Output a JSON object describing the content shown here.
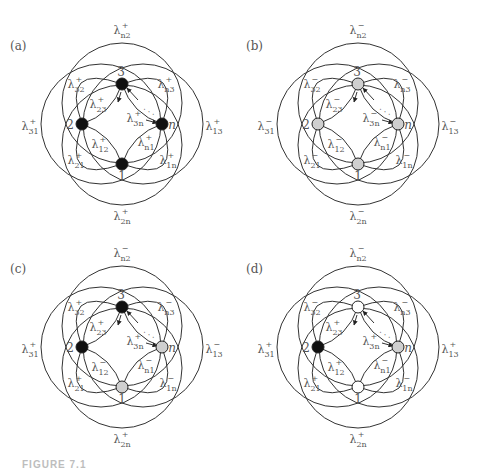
{
  "figure": {
    "caption_fragment": "FIGURE 7.1",
    "node_colors": {
      "black": "#111111",
      "gray": "#cfcfcf",
      "white": "#ffffff"
    },
    "edge_color": "#333333",
    "panels": [
      {
        "id": "a",
        "label": "(a)",
        "nodes": [
          {
            "name": "3",
            "fill": "black"
          },
          {
            "name": "2",
            "fill": "black"
          },
          {
            "name": "n",
            "fill": "black"
          },
          {
            "name": "1",
            "fill": "black"
          }
        ],
        "rates": {
          "n2": "+",
          "31": "+",
          "13": "+",
          "2n": "+",
          "32": "+",
          "23": "+",
          "n3": "+",
          "3n": "+",
          "12": "+",
          "21": "+",
          "n1": "+",
          "1n": "+"
        }
      },
      {
        "id": "b",
        "label": "(b)",
        "nodes": [
          {
            "name": "3",
            "fill": "gray"
          },
          {
            "name": "2",
            "fill": "gray"
          },
          {
            "name": "n",
            "fill": "gray"
          },
          {
            "name": "1",
            "fill": "gray"
          }
        ],
        "rates": {
          "n2": "−",
          "31": "−",
          "13": "−",
          "2n": "−",
          "32": "−",
          "23": "−",
          "n3": "−",
          "3n": "−",
          "12": "−",
          "21": "−",
          "n1": "−",
          "1n": "−"
        }
      },
      {
        "id": "c",
        "label": "(c)",
        "nodes": [
          {
            "name": "3",
            "fill": "black"
          },
          {
            "name": "2",
            "fill": "black"
          },
          {
            "name": "n",
            "fill": "gray"
          },
          {
            "name": "1",
            "fill": "gray"
          }
        ],
        "rates": {
          "n2": "−",
          "31": "+",
          "13": "−",
          "2n": "+",
          "32": "+",
          "23": "+",
          "n3": "−",
          "3n": "+",
          "12": "−",
          "21": "+",
          "n1": "−",
          "1n": "−"
        }
      },
      {
        "id": "d",
        "label": "(d)",
        "nodes": [
          {
            "name": "3",
            "fill": "white"
          },
          {
            "name": "2",
            "fill": "black"
          },
          {
            "name": "n",
            "fill": "gray"
          },
          {
            "name": "1",
            "fill": "white"
          }
        ],
        "rates": {
          "n2": "−",
          "31": "+",
          "13": "+",
          "2n": "+",
          "32": "−",
          "23": "+",
          "n3": "−",
          "3n": "+",
          "12": "+",
          "21": "+",
          "n1": "−",
          "1n": "−"
        }
      }
    ],
    "symbol": "λ",
    "ellipsis": "· · ·"
  }
}
